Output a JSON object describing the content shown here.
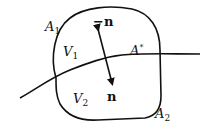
{
  "diagram": {
    "labels": {
      "A1": {
        "main": "A",
        "sub": "1"
      },
      "A2": {
        "main": "A",
        "sub": "2"
      },
      "V1": {
        "main": "V",
        "sub": "1"
      },
      "V2": {
        "main": "V",
        "sub": "2"
      },
      "Astar": {
        "main": "A",
        "sup": "*"
      },
      "neg_n": "−n",
      "n": "n"
    },
    "colors": {
      "stroke": "#111111",
      "background": "#ffffff"
    }
  }
}
